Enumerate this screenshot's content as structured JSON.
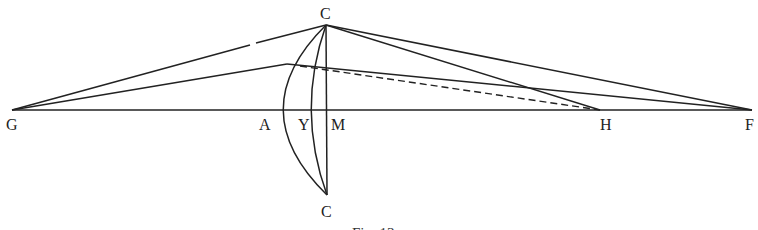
{
  "figure": {
    "caption": "Fig. 13",
    "labels": {
      "C_top": "C",
      "C_bottom": "C",
      "G": "G",
      "A": "A",
      "Y": "Y",
      "M": "M",
      "H": "H",
      "F": "F"
    },
    "colors": {
      "ink": "#222222",
      "background": "#ffffff"
    }
  }
}
